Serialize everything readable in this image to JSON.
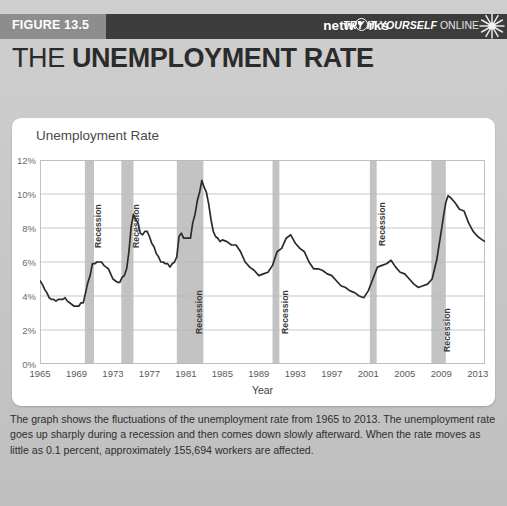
{
  "header": {
    "figure_label": "FIGURE 13.5",
    "brand_prefix": "netw",
    "brand_suffix": "rks",
    "try_it": "TRY IT YOURSELF",
    "online": "ONLINE",
    "burst_icon": "sunburst-icon"
  },
  "title": {
    "thin": "THE ",
    "bold": "UNEMPLOYMENT RATE"
  },
  "chart_title": "Unemployment Rate",
  "caption": "The graph shows the fluctuations of the unemployment rate from 1965 to 2013. The unemployment rate goes up sharply during a recession and then comes down slowly afterward. When the rate moves as little as 0.1 percent, approximately 155,694 workers are affected.",
  "colors": {
    "line": "#2b2b2b",
    "recession_band": "#c3c3c3",
    "grid": "#b9b9b9",
    "card": "#ffffff",
    "page_bg": "#c8c8c8",
    "header_bar": "#8d8d8d",
    "header_strip": "#3c3c3c"
  },
  "chart_data": {
    "type": "line",
    "title": "Unemployment Rate",
    "xlabel": "Year",
    "ylabel": "",
    "xlim": [
      1965,
      2013.8
    ],
    "ylim": [
      0,
      12
    ],
    "grid": true,
    "legend": "none",
    "ytick_labels": [
      "0%",
      "2%",
      "4%",
      "6%",
      "8%",
      "10%",
      "12%"
    ],
    "yticks": [
      0,
      2,
      4,
      6,
      8,
      10,
      12
    ],
    "xticks": [
      1965,
      1969,
      1973,
      1977,
      1981,
      1985,
      1989,
      1993,
      1997,
      2001,
      2005,
      2009,
      2013
    ],
    "xtick_labels": [
      "1965",
      "1969",
      "1973",
      "1977",
      "1981",
      "1985",
      "1989",
      "1993",
      "1997",
      "2001",
      "2005",
      "2009",
      "2013"
    ],
    "series": [
      {
        "name": "Unemployment Rate",
        "unit": "percent",
        "x": [
          1965.0,
          1965.25,
          1965.5,
          1965.75,
          1966.0,
          1966.25,
          1966.5,
          1966.75,
          1967.0,
          1967.25,
          1967.5,
          1967.75,
          1968.0,
          1968.25,
          1968.5,
          1968.75,
          1969.0,
          1969.25,
          1969.5,
          1969.75,
          1970.0,
          1970.25,
          1970.5,
          1970.75,
          1971.0,
          1971.25,
          1971.5,
          1971.75,
          1972.0,
          1972.25,
          1972.5,
          1972.75,
          1973.0,
          1973.25,
          1973.5,
          1973.75,
          1974.0,
          1974.25,
          1974.5,
          1974.75,
          1975.0,
          1975.25,
          1975.5,
          1975.75,
          1976.0,
          1976.25,
          1976.5,
          1976.75,
          1977.0,
          1977.25,
          1977.5,
          1977.75,
          1978.0,
          1978.25,
          1978.5,
          1978.75,
          1979.0,
          1979.25,
          1979.5,
          1979.75,
          1980.0,
          1980.25,
          1980.5,
          1980.75,
          1981.0,
          1981.25,
          1981.5,
          1981.75,
          1982.0,
          1982.25,
          1982.5,
          1982.75,
          1983.0,
          1983.25,
          1983.5,
          1983.75,
          1984.0,
          1984.25,
          1984.5,
          1984.75,
          1985.0,
          1985.5,
          1986.0,
          1986.5,
          1987.0,
          1987.5,
          1988.0,
          1988.5,
          1989.0,
          1989.5,
          1990.0,
          1990.5,
          1991.0,
          1991.5,
          1992.0,
          1992.5,
          1993.0,
          1993.5,
          1994.0,
          1994.5,
          1995.0,
          1995.5,
          1996.0,
          1996.5,
          1997.0,
          1997.5,
          1998.0,
          1998.5,
          1999.0,
          1999.5,
          2000.0,
          2000.5,
          2001.0,
          2001.5,
          2002.0,
          2002.5,
          2003.0,
          2003.5,
          2004.0,
          2004.5,
          2005.0,
          2005.5,
          2006.0,
          2006.5,
          2007.0,
          2007.5,
          2008.0,
          2008.5,
          2009.0,
          2009.25,
          2009.5,
          2009.75,
          2010.0,
          2010.5,
          2011.0,
          2011.5,
          2012.0,
          2012.5,
          2013.0,
          2013.5,
          2013.8
        ],
        "y": [
          4.9,
          4.7,
          4.4,
          4.2,
          3.9,
          3.8,
          3.8,
          3.7,
          3.8,
          3.8,
          3.8,
          3.9,
          3.7,
          3.6,
          3.5,
          3.4,
          3.4,
          3.4,
          3.6,
          3.6,
          4.2,
          4.8,
          5.2,
          5.9,
          5.9,
          6.0,
          6.0,
          6.0,
          5.8,
          5.7,
          5.6,
          5.3,
          5.0,
          4.9,
          4.8,
          4.8,
          5.1,
          5.2,
          5.6,
          6.6,
          8.1,
          8.8,
          8.5,
          8.3,
          7.7,
          7.6,
          7.8,
          7.8,
          7.5,
          7.1,
          6.9,
          6.5,
          6.3,
          6.0,
          6.0,
          5.9,
          5.9,
          5.7,
          5.9,
          6.0,
          6.3,
          7.5,
          7.7,
          7.4,
          7.4,
          7.4,
          7.4,
          8.3,
          8.8,
          9.6,
          10.1,
          10.8,
          10.4,
          10.1,
          9.4,
          8.5,
          7.8,
          7.5,
          7.4,
          7.2,
          7.3,
          7.2,
          7.0,
          7.0,
          6.6,
          6.0,
          5.7,
          5.5,
          5.2,
          5.3,
          5.4,
          5.8,
          6.6,
          6.8,
          7.4,
          7.6,
          7.1,
          6.8,
          6.6,
          6.0,
          5.6,
          5.6,
          5.5,
          5.3,
          5.2,
          4.9,
          4.6,
          4.5,
          4.3,
          4.2,
          4.0,
          3.9,
          4.3,
          5.0,
          5.7,
          5.8,
          5.9,
          6.1,
          5.7,
          5.4,
          5.3,
          5.0,
          4.7,
          4.5,
          4.6,
          4.7,
          5.0,
          6.1,
          7.8,
          8.7,
          9.5,
          9.9,
          9.8,
          9.5,
          9.1,
          9.0,
          8.3,
          7.8,
          7.5,
          7.3,
          7.2
        ]
      }
    ],
    "recessions": [
      {
        "label": "Recession",
        "start": 1969.92,
        "end": 1970.92
      },
      {
        "label": "Recession",
        "start": 1973.92,
        "end": 1975.25
      },
      {
        "label": "Recession",
        "start": 1980.0,
        "end": 1982.92
      },
      {
        "label": "Recession",
        "start": 1990.5,
        "end": 1991.25
      },
      {
        "label": "Recession",
        "start": 2001.17,
        "end": 2001.92
      },
      {
        "label": "Recession",
        "start": 2007.92,
        "end": 2009.5
      }
    ],
    "annotations": [
      {
        "text": "peak 10.8% (1982)",
        "x": 1982.75,
        "y": 10.8
      },
      {
        "text": "peak 9.9% (2009)",
        "x": 2009.75,
        "y": 9.9
      },
      {
        "text": "low 3.4% (1968-69)",
        "x": 1968.75,
        "y": 3.4
      }
    ]
  }
}
